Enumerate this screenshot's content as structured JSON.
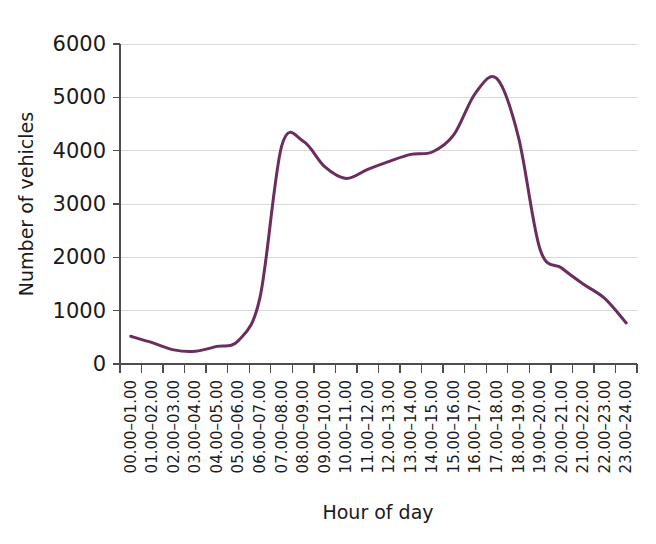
{
  "chart_data": {
    "type": "line",
    "title": "",
    "subtitle": "",
    "xlabel": "Hour of day",
    "ylabel": "Number of vehicles",
    "categories": [
      "00.00–01.00",
      "01.00–02.00",
      "02.00–03.00",
      "03.00–04.00",
      "04.00–05.00",
      "05.00–06.00",
      "06.00–07.00",
      "07.00–08.00",
      "08.00–09.00",
      "09.00–10.00",
      "10.00–11.00",
      "11.00–12.00",
      "12.00–13.00",
      "13.00–14.00",
      "14.00–15.00",
      "15.00–16.00",
      "16.00–17.00",
      "17.00–18.00",
      "18.00–19.00",
      "19.00–20.00",
      "20.00–21.00",
      "21.00–22.00",
      "22.00–23.00",
      "23.00–24.00"
    ],
    "values": [
      520,
      400,
      265,
      240,
      330,
      440,
      1250,
      4080,
      4180,
      3700,
      3480,
      3650,
      3800,
      3930,
      3975,
      4300,
      5080,
      5350,
      4250,
      2150,
      1800,
      1500,
      1230,
      770
    ],
    "series": [
      {
        "name": "Number of vehicles",
        "values": [
          520,
          400,
          265,
          240,
          330,
          440,
          1250,
          4080,
          4180,
          3700,
          3480,
          3650,
          3800,
          3930,
          3975,
          4300,
          5080,
          5350,
          4250,
          2150,
          1800,
          1500,
          1230,
          770
        ],
        "color": "#6b2d5e"
      }
    ],
    "ylim": [
      0,
      6000
    ],
    "ytick_values": [
      0,
      1000,
      2000,
      3000,
      4000,
      5000,
      6000
    ],
    "ytick_labels": [
      "0",
      "1000",
      "2000",
      "3000",
      "4000",
      "5000",
      "6000"
    ],
    "xlim": [
      0,
      24
    ],
    "grid": "horizontal",
    "legend": "none",
    "line_color": "#6b2d5e",
    "gridline_color": "#d9d9d9",
    "axis_color": "#4d4d4d",
    "background_color": "#ffffff"
  }
}
